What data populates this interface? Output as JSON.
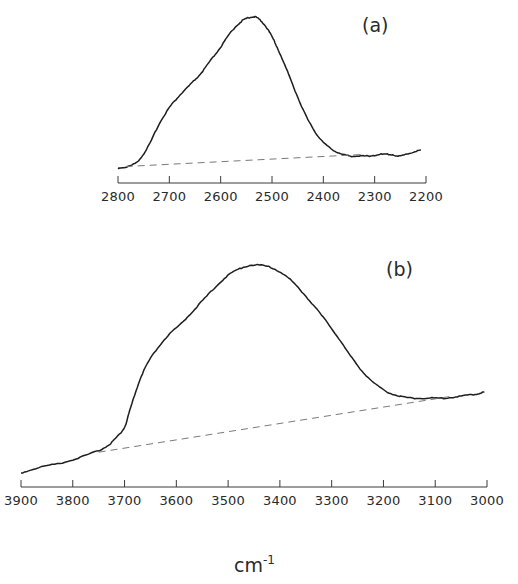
{
  "chart_data": [
    {
      "type": "line",
      "panel_label": "(a)",
      "title": "",
      "xlabel": "cm-1",
      "ylabel": "",
      "xlim": [
        2800,
        2200
      ],
      "x_reversed": true,
      "grid": false,
      "legend": null,
      "x_ticks": [
        2800,
        2700,
        2600,
        2500,
        2400,
        2300,
        2200
      ],
      "tick_labels": [
        "2800",
        "2700",
        "2600",
        "2500",
        "2400",
        "2300",
        "2200"
      ],
      "series": [
        {
          "name": "spectrum",
          "style": "solid",
          "x": [
            2800,
            2780,
            2760,
            2740,
            2720,
            2700,
            2680,
            2660,
            2640,
            2620,
            2600,
            2580,
            2560,
            2545,
            2533,
            2520,
            2505,
            2490,
            2470,
            2450,
            2430,
            2410,
            2390,
            2370,
            2350,
            2330,
            2310,
            2290,
            2270,
            2250,
            2230,
            2210
          ],
          "y": [
            0.0,
            0.01,
            0.05,
            0.15,
            0.29,
            0.4,
            0.48,
            0.55,
            0.62,
            0.71,
            0.8,
            0.9,
            0.97,
            0.995,
            1.0,
            0.97,
            0.9,
            0.8,
            0.64,
            0.47,
            0.32,
            0.21,
            0.14,
            0.1,
            0.08,
            0.08,
            0.08,
            0.09,
            0.09,
            0.08,
            0.1,
            0.12
          ]
        },
        {
          "name": "baseline",
          "style": "dashed",
          "x": [
            2785,
            2320
          ],
          "y": [
            0.01,
            0.09
          ]
        }
      ]
    },
    {
      "type": "line",
      "panel_label": "(b)",
      "title": "",
      "xlabel": "cm-1",
      "ylabel": "",
      "xlim": [
        3900,
        3000
      ],
      "x_reversed": true,
      "grid": false,
      "legend": null,
      "x_ticks": [
        3900,
        3800,
        3700,
        3600,
        3500,
        3400,
        3300,
        3200,
        3100,
        3000
      ],
      "tick_labels": [
        "3900",
        "3800",
        "3700",
        "3600",
        "3500",
        "3400",
        "3300",
        "3200",
        "3100",
        "3000"
      ],
      "series": [
        {
          "name": "spectrum",
          "style": "solid",
          "x": [
            3900,
            3860,
            3820,
            3780,
            3740,
            3720,
            3700,
            3690,
            3670,
            3650,
            3620,
            3590,
            3560,
            3530,
            3500,
            3470,
            3440,
            3410,
            3380,
            3350,
            3320,
            3290,
            3260,
            3230,
            3200,
            3170,
            3140,
            3110,
            3080,
            3050,
            3020,
            3005
          ],
          "y": [
            0.0,
            0.03,
            0.05,
            0.08,
            0.12,
            0.16,
            0.22,
            0.3,
            0.45,
            0.55,
            0.65,
            0.72,
            0.8,
            0.88,
            0.95,
            0.99,
            1.0,
            0.98,
            0.93,
            0.85,
            0.76,
            0.66,
            0.55,
            0.46,
            0.4,
            0.37,
            0.36,
            0.36,
            0.36,
            0.37,
            0.38,
            0.39
          ]
        },
        {
          "name": "baseline",
          "style": "dashed",
          "x": [
            3750,
            3065
          ],
          "y": [
            0.1,
            0.37
          ]
        }
      ]
    }
  ],
  "labels": {
    "panel_a": "(a)",
    "panel_b": "(b)",
    "unit": "cm",
    "unit_sup": "-1"
  }
}
